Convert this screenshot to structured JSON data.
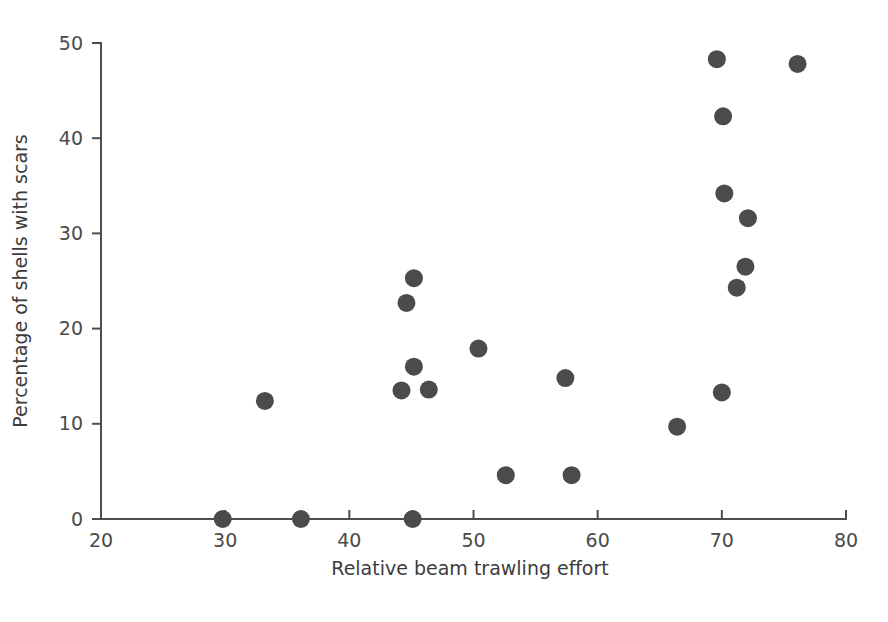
{
  "figure": {
    "background_color": "#ffffff",
    "marker_color": "#4b4b4b",
    "axis_color": "#4d4d4d",
    "caption": ""
  },
  "chart_data": {
    "type": "scatter",
    "title": "",
    "xlabel": "Relative beam trawling effort",
    "ylabel": "Percentage of shells with scars",
    "xlim": [
      20,
      80
    ],
    "ylim": [
      0,
      50
    ],
    "xticks": [
      20,
      30,
      40,
      50,
      60,
      70,
      80
    ],
    "xtick_labels": [
      "20",
      "30",
      "40",
      "50",
      "60",
      "70",
      "80"
    ],
    "yticks": [
      0,
      10,
      20,
      30,
      40,
      50
    ],
    "ytick_labels": [
      "0",
      "10",
      "20",
      "30",
      "40",
      "50"
    ],
    "grid": false,
    "legend": null,
    "marker_size_px": 18,
    "series": [
      {
        "name": "shell scarring vs trawling effort",
        "color": "#4b4b4b",
        "points": [
          {
            "x": 29.8,
            "y": 0.0
          },
          {
            "x": 33.2,
            "y": 12.4
          },
          {
            "x": 36.1,
            "y": 0.0
          },
          {
            "x": 44.2,
            "y": 13.5
          },
          {
            "x": 44.6,
            "y": 22.7
          },
          {
            "x": 45.1,
            "y": 0.0
          },
          {
            "x": 45.2,
            "y": 16.0
          },
          {
            "x": 45.2,
            "y": 25.3
          },
          {
            "x": 46.4,
            "y": 13.6
          },
          {
            "x": 50.4,
            "y": 17.9
          },
          {
            "x": 52.6,
            "y": 4.6
          },
          {
            "x": 57.4,
            "y": 14.8
          },
          {
            "x": 57.9,
            "y": 4.6
          },
          {
            "x": 66.4,
            "y": 9.7
          },
          {
            "x": 69.6,
            "y": 48.3
          },
          {
            "x": 70.0,
            "y": 13.3
          },
          {
            "x": 70.1,
            "y": 42.3
          },
          {
            "x": 70.2,
            "y": 34.2
          },
          {
            "x": 71.2,
            "y": 24.3
          },
          {
            "x": 71.9,
            "y": 26.5
          },
          {
            "x": 72.1,
            "y": 31.6
          },
          {
            "x": 76.1,
            "y": 47.8
          }
        ]
      }
    ]
  }
}
